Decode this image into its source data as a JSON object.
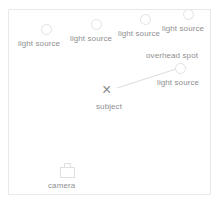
{
  "diagram": {
    "colors": {
      "background": "#ffffff",
      "frame_border": "#e9e9e9",
      "label_text": "#8f8f8f",
      "lamp_outline": "#e2e2e2",
      "link_line": "#dcdcdc",
      "subject_marker": "#8c8c8c"
    },
    "lights": [
      {
        "id": "light-1",
        "label": "light source",
        "cx": 46,
        "cy": 29,
        "label_x": 18,
        "label_y": 39
      },
      {
        "id": "light-2",
        "label": "light source",
        "cx": 96,
        "cy": 24,
        "label_x": 70,
        "label_y": 34
      },
      {
        "id": "light-3",
        "label": "light source",
        "cx": 145,
        "cy": 19,
        "label_x": 118,
        "label_y": 29
      },
      {
        "id": "light-4",
        "label": "light source",
        "cx": 188,
        "cy": 14,
        "label_x": 162,
        "label_y": 24
      },
      {
        "id": "light-5",
        "label": "light source",
        "cx": 180,
        "cy": 68,
        "label_x": 157,
        "label_y": 78
      }
    ],
    "annotations": [
      {
        "id": "overhead-spot",
        "label": "overhead spot",
        "x": 146,
        "y": 51
      }
    ],
    "subject": {
      "marker": "×",
      "label": "subject",
      "marker_x": 102,
      "marker_y": 82,
      "label_x": 96,
      "label_y": 102
    },
    "camera": {
      "label": "camera",
      "icon": "camera-icon",
      "x": 60,
      "y": 163,
      "label_x": 48,
      "label_y": 181
    },
    "links": [
      {
        "id": "subject-to-light-5",
        "x1": 117,
        "y1": 88,
        "x2": 176,
        "y2": 69
      }
    ]
  }
}
